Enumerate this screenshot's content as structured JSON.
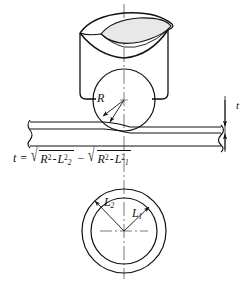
{
  "figure": {
    "background_color": "#ffffff",
    "line_color": "#111111",
    "fill_color": "#e8e8e8"
  },
  "labels": {
    "radius": "R",
    "thickness": "t",
    "chord_outer": "L",
    "chord_outer_sub": "2",
    "chord_inner": "L",
    "chord_inner_sub": "1"
  },
  "formula": {
    "lhs": "t",
    "equals": "=",
    "radical_sign": "√",
    "term1_base": "R",
    "term1_exp": "2",
    "term1_op": "-",
    "term1_var": "L",
    "term1_var_exp": "2",
    "term1_var_sub": "2",
    "operator": "−",
    "term2_base": "R",
    "term2_exp": "2",
    "term2_op": "-",
    "term2_var": "L",
    "term2_var_exp": "2",
    "term2_var_sub": "1"
  },
  "geometry": {
    "centerline_x": 124,
    "punch_circle": {
      "cx": 124,
      "cy": 100,
      "r": 31
    },
    "outer_circle": {
      "cx": 124,
      "cy": 231,
      "r": 42
    },
    "inner_circle": {
      "cx": 124,
      "cy": 231,
      "r": 33
    },
    "sheet_top_y": 122,
    "sheet_mid_y": 129,
    "sheet_bottom_y": 146
  }
}
